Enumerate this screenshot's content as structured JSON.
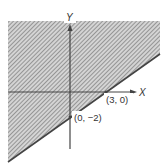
{
  "diagram": {
    "type": "linear-inequality-half-plane",
    "axes": {
      "x_label": "X",
      "y_label": "Y"
    },
    "boundary_line": {
      "points": [
        {
          "label": "(3, 0)",
          "x": 3,
          "y": 0
        },
        {
          "label": "(0, −2)",
          "x": 0,
          "y": -2
        }
      ],
      "style": "solid"
    },
    "shaded_region": "upper-left side of the line (above the line)",
    "colors": {
      "hatch": "#6e6e6e",
      "axis": "#444444",
      "line": "#444444",
      "background": "#ffffff"
    }
  }
}
